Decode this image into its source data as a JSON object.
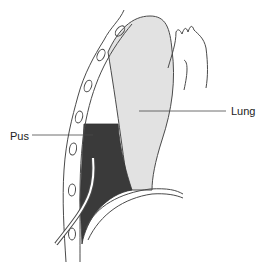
{
  "diagram": {
    "labels": {
      "pus": "Pus",
      "lung": "Lung"
    },
    "colors": {
      "lung_fill": "#e2e2e2",
      "pus_fill": "#3a3a3a",
      "outline": "#4a4a4a",
      "background": "#ffffff"
    }
  }
}
